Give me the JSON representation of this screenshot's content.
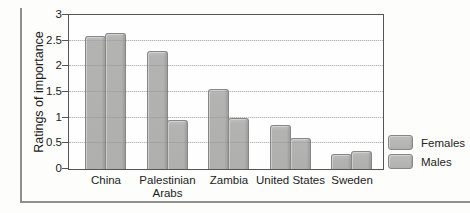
{
  "figure": {
    "background": "#fdfdfc",
    "rule_color": "#8f8f8f"
  },
  "chart_data": {
    "type": "bar",
    "title": "",
    "xlabel": "",
    "ylabel": "Ratings of importance",
    "categories": [
      "China",
      "Palestinian Arabs",
      "Zambia",
      "United States",
      "Sweden"
    ],
    "series": [
      {
        "name": "Females",
        "values": [
          2.6,
          2.3,
          1.55,
          0.85,
          0.3
        ]
      },
      {
        "name": "Males",
        "values": [
          2.65,
          0.95,
          1.0,
          0.6,
          0.35
        ]
      }
    ],
    "ylim": [
      0,
      3
    ],
    "yticks": [
      0,
      0.5,
      1,
      1.5,
      2,
      2.5,
      3
    ],
    "grid": "horizontal-dotted",
    "legend_position": "right",
    "bar_color": "#b3b3b1",
    "bar_edge_color": "#87878b",
    "plot_border_color": "#565656"
  },
  "legend": {
    "items": [
      {
        "label": "Females"
      },
      {
        "label": "Males"
      }
    ]
  }
}
